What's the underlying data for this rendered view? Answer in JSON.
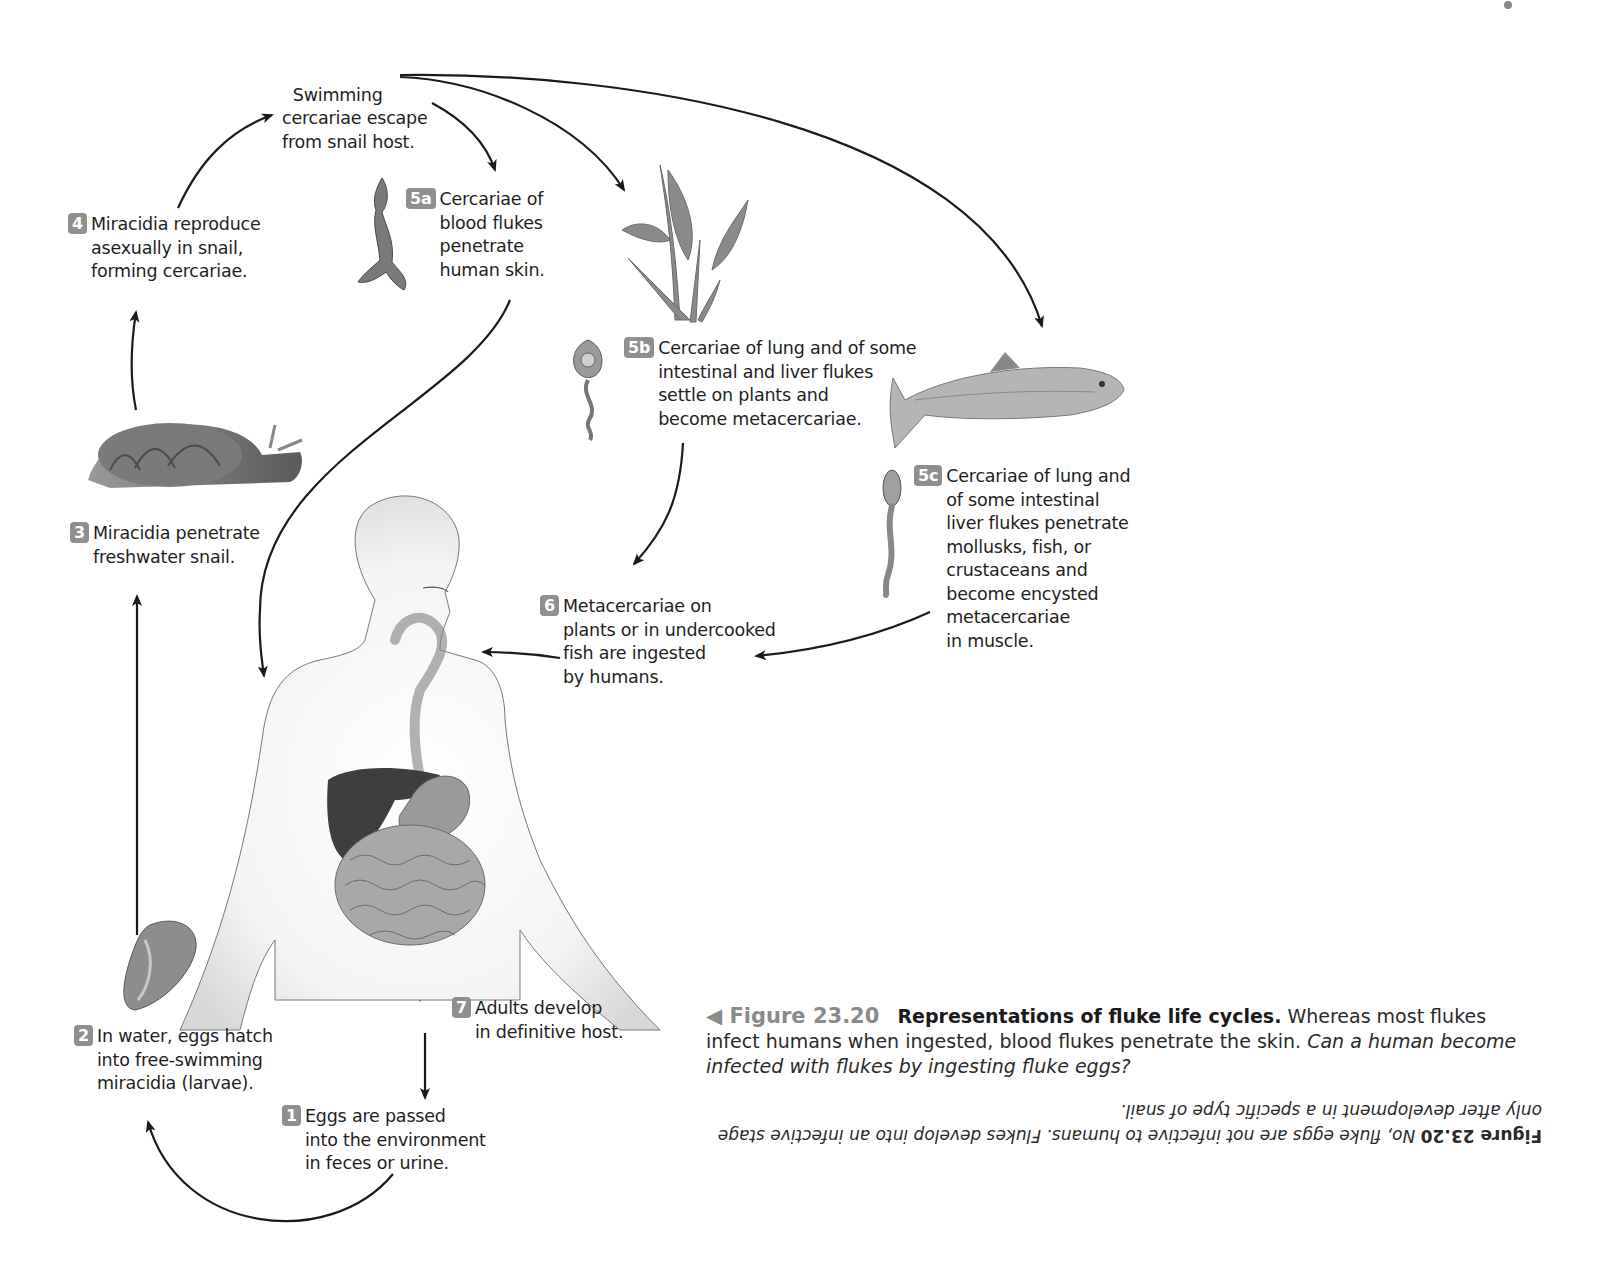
{
  "diagram": {
    "type": "life-cycle",
    "title": "Representations of fluke life cycles",
    "stages": [
      {
        "id": "top",
        "badge": "",
        "text": "Swimming\ncercariae escape\nfrom snail host."
      },
      {
        "id": "4",
        "badge": "4",
        "text": "Miracidia reproduce\nasexually in snail,\nforming cercariae."
      },
      {
        "id": "5a",
        "badge": "5a",
        "text": "Cercariae of\nblood flukes\npenetrate\nhuman skin."
      },
      {
        "id": "5b",
        "badge": "5b",
        "text": "Cercariae of lung and of some\nintestinal and liver flukes\nsettle on plants and\nbecome metacercariae."
      },
      {
        "id": "5c",
        "badge": "5c",
        "text": "Cercariae of lung and\nof some intestinal\nliver flukes penetrate\nmollusks, fish, or\ncrustaceans and\nbecome encysted\nmetacercariae\nin muscle."
      },
      {
        "id": "3",
        "badge": "3",
        "text": "Miracidia penetrate\nfreshwater snail."
      },
      {
        "id": "6",
        "badge": "6",
        "text": "Metacercariae on\nplants or in undercooked\nfish are ingested\nby humans."
      },
      {
        "id": "7",
        "badge": "7",
        "text": "Adults develop\nin definitive host."
      },
      {
        "id": "2",
        "badge": "2",
        "text": "In water, eggs hatch\ninto free-swimming\nmiracidia (larvae)."
      },
      {
        "id": "1",
        "badge": "1",
        "text": "Eggs are passed\ninto the environment\nin feces or urine."
      }
    ],
    "illustrations": [
      "snail",
      "blood-fluke-cercaria",
      "aquatic-plant",
      "cercaria-5b",
      "fish",
      "cercaria-5c",
      "human-digestive-system",
      "fluke-egg"
    ],
    "colors": {
      "badge": "#8f8f8f",
      "arrow": "#1a1a1a",
      "figure_label": "#8a8a8a"
    }
  },
  "caption": {
    "figure_label": "Figure 23.20",
    "title": "Representations of fluke life cycles.",
    "body": " Whereas most flukes infect humans when ingested, blood flukes penetrate the skin. ",
    "question": "Can a human become infected with flukes by ingesting fluke eggs?"
  },
  "answer": {
    "figure_label": "Figure 23.20",
    "text": " No, fluke eggs are not infective to humans. Flukes develop into an infective stage only after development in a specific type of snail."
  }
}
